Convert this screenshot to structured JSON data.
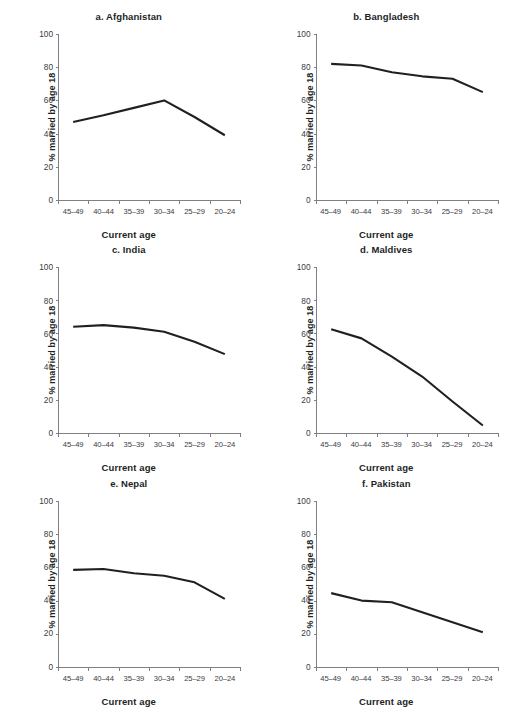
{
  "figure": {
    "suptitle": "",
    "suptitle_note": "clipped-title-row"
  },
  "axis": {
    "ylabel": "% married by age 18",
    "xlabel": "Current age",
    "yticks": [
      "0",
      "20",
      "40",
      "60",
      "80",
      "100"
    ],
    "xticks": [
      "45–49",
      "40–44",
      "35–39",
      "30–34",
      "25–29",
      "20–24"
    ]
  },
  "panels": [
    {
      "key": "afghanistan",
      "title": "a. Afghanistan"
    },
    {
      "key": "bangladesh",
      "title": "b. Bangladesh"
    },
    {
      "key": "india",
      "title": "c. India"
    },
    {
      "key": "maldives",
      "title": "d. Maldives"
    },
    {
      "key": "nepal",
      "title": "e. Nepal"
    },
    {
      "key": "pakistan",
      "title": "f. Pakistan"
    }
  ],
  "colors": {
    "line": "#231f20",
    "axis": "#808084",
    "text": "#221f1f"
  },
  "chart_data": [
    {
      "type": "line",
      "title": "a. Afghanistan",
      "xlabel": "Current age",
      "ylabel": "% married by age 18",
      "categories": [
        "45–49",
        "40–44",
        "35–39",
        "30–34",
        "25–29",
        "20–24"
      ],
      "values": [
        47,
        51,
        55.5,
        60,
        50,
        39
      ],
      "ylim": [
        0,
        100
      ],
      "yticks": [
        0,
        20,
        40,
        60,
        80,
        100
      ],
      "grid": false,
      "legend": "none"
    },
    {
      "type": "line",
      "title": "b. Bangladesh",
      "xlabel": "Current age",
      "ylabel": "% married by age 18",
      "categories": [
        "45–49",
        "40–44",
        "35–39",
        "30–34",
        "25–29",
        "20–24"
      ],
      "values": [
        82,
        81,
        77,
        74.5,
        73,
        65
      ],
      "ylim": [
        0,
        100
      ],
      "yticks": [
        0,
        20,
        40,
        60,
        80,
        100
      ],
      "grid": false,
      "legend": "none"
    },
    {
      "type": "line",
      "title": "c. India",
      "xlabel": "Current age",
      "ylabel": "% married by age 18",
      "categories": [
        "45–49",
        "40–44",
        "35–39",
        "30–34",
        "25–29",
        "20–24"
      ],
      "values": [
        64,
        65,
        63.5,
        61,
        55,
        47.5
      ],
      "ylim": [
        0,
        100
      ],
      "yticks": [
        0,
        20,
        40,
        60,
        80,
        100
      ],
      "grid": false,
      "legend": "none"
    },
    {
      "type": "line",
      "title": "d. Maldives",
      "xlabel": "Current age",
      "ylabel": "% married by age 18",
      "categories": [
        "45–49",
        "40–44",
        "35–39",
        "30–34",
        "25–29",
        "20–24"
      ],
      "values": [
        62.5,
        57,
        46,
        34,
        19,
        4.5
      ],
      "ylim": [
        0,
        100
      ],
      "yticks": [
        0,
        20,
        40,
        60,
        80,
        100
      ],
      "grid": false,
      "legend": "none"
    },
    {
      "type": "line",
      "title": "e. Nepal",
      "xlabel": "Current age",
      "ylabel": "% married by age 18",
      "categories": [
        "45–49",
        "40–44",
        "35–39",
        "30–34",
        "25–29",
        "20–24"
      ],
      "values": [
        58.5,
        59,
        56.5,
        55,
        51,
        41
      ],
      "ylim": [
        0,
        100
      ],
      "yticks": [
        0,
        20,
        40,
        60,
        80,
        100
      ],
      "grid": false,
      "legend": "none"
    },
    {
      "type": "line",
      "title": "f. Pakistan",
      "xlabel": "Current age",
      "ylabel": "% married by age 18",
      "categories": [
        "45–49",
        "40–44",
        "35–39",
        "30–34",
        "25–29",
        "20–24"
      ],
      "values": [
        44.5,
        40,
        39,
        33,
        27,
        21
      ],
      "ylim": [
        0,
        100
      ],
      "yticks": [
        0,
        20,
        40,
        60,
        80,
        100
      ],
      "grid": false,
      "legend": "none"
    }
  ]
}
